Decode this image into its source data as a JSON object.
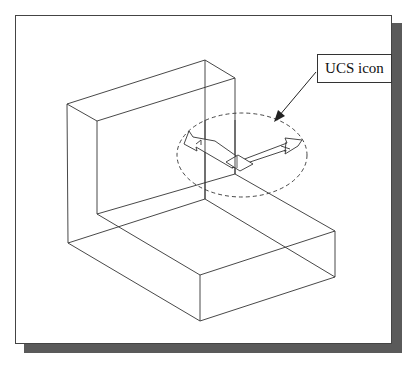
{
  "figure": {
    "callout_label": "UCS icon",
    "colors": {
      "line": "#333333",
      "frame_border": "#444444",
      "shadow": "#5a5a5a",
      "background": "#ffffff"
    },
    "model": "L-shaped isometric wireframe solid",
    "highlight": "dashed ellipse around UCS icon with arrow callout"
  }
}
